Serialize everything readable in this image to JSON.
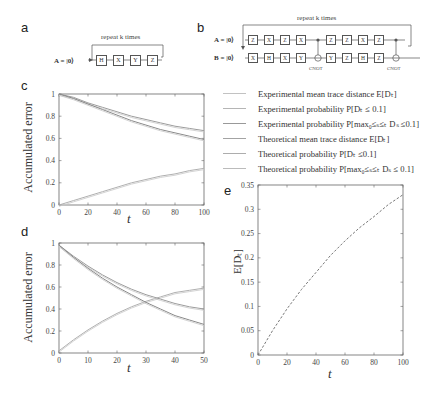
{
  "panels": {
    "a": {
      "letter": "a",
      "repeat_label": "repeat k times",
      "qubit_label": "A = |0⟩",
      "gates": [
        "H",
        "X",
        "Y",
        "Z"
      ]
    },
    "b": {
      "letter": "b",
      "repeat_label": "repeat k times",
      "qubit_a_label": "A = |0⟩",
      "qubit_b_label": "B = |0⟩",
      "gates_a": [
        "Z",
        "X",
        "Z",
        "X",
        "●",
        "Z",
        "Z",
        "X",
        "Z",
        "●"
      ],
      "gates_b": [
        "X",
        "H",
        "X",
        "Y",
        "⊕",
        "Y",
        "Z",
        "H",
        "Z",
        "⊕"
      ],
      "cnot_label": "CNOT"
    },
    "c": {
      "letter": "c"
    },
    "d": {
      "letter": "d"
    },
    "e": {
      "letter": "e"
    }
  },
  "legend": {
    "items": [
      {
        "label": "Experimental mean trace distance E[Dₜ]",
        "color": "#b7b7b7"
      },
      {
        "label": "Experimental probability P[Dₜ ≤ 0.1]",
        "color": "#a9a9a9"
      },
      {
        "label": "Experimental probability P[max₀≤ₛ≤ₜ Dₛ ≤0.1]",
        "color": "#8f8f8f"
      },
      {
        "label": "Theoretical mean trace distance E[Dₜ]",
        "color": "#9a9a9a"
      },
      {
        "label": "Theoretical probability P[Dₜ ≤0.1]",
        "color": "#a5a5a5"
      },
      {
        "label": "Theoretical probability P[max₀≤ₛ≤ₜ Dₛ ≤ 0.1]",
        "color": "#b0b0b0"
      }
    ]
  },
  "chart_data": [
    {
      "panel": "c",
      "type": "line",
      "title": "",
      "xlabel": "t",
      "ylabel": "Accumulated error",
      "xlim": [
        0,
        100
      ],
      "ylim": [
        0,
        1
      ],
      "xticks": [
        0,
        20,
        40,
        60,
        80,
        100
      ],
      "yticks": [
        0,
        0.2,
        0.4,
        0.6,
        0.8,
        1
      ],
      "x": [
        0,
        10,
        20,
        30,
        40,
        50,
        60,
        70,
        80,
        90,
        100
      ],
      "series": [
        {
          "name": "Mean trace distance E[Dt]",
          "values": [
            0.0,
            0.04,
            0.08,
            0.12,
            0.16,
            0.2,
            0.23,
            0.26,
            0.28,
            0.31,
            0.33
          ]
        },
        {
          "name": "Probability P[Dt ≤ 0.1]",
          "values": [
            1.0,
            0.97,
            0.92,
            0.88,
            0.84,
            0.8,
            0.77,
            0.74,
            0.71,
            0.69,
            0.67
          ]
        },
        {
          "name": "Probability P[max Ds ≤ 0.1]",
          "values": [
            1.0,
            0.96,
            0.91,
            0.86,
            0.81,
            0.76,
            0.72,
            0.68,
            0.65,
            0.62,
            0.59
          ]
        }
      ]
    },
    {
      "panel": "d",
      "type": "line",
      "title": "",
      "xlabel": "t",
      "ylabel": "Accumulated error",
      "xlim": [
        0,
        50
      ],
      "ylim": [
        0,
        1
      ],
      "xticks": [
        0,
        10,
        20,
        30,
        40,
        50
      ],
      "yticks": [
        0,
        0.2,
        0.4,
        0.6,
        0.8,
        1
      ],
      "x": [
        0,
        5,
        10,
        15,
        20,
        25,
        30,
        35,
        40,
        45,
        50
      ],
      "series": [
        {
          "name": "Mean trace distance E[Dt]",
          "values": [
            0.02,
            0.12,
            0.21,
            0.29,
            0.36,
            0.42,
            0.47,
            0.51,
            0.55,
            0.57,
            0.59
          ]
        },
        {
          "name": "Probability P[Dt ≤ 0.1]",
          "values": [
            0.98,
            0.88,
            0.79,
            0.71,
            0.64,
            0.58,
            0.53,
            0.49,
            0.45,
            0.42,
            0.4
          ]
        },
        {
          "name": "Probability P[max Ds ≤ 0.1]",
          "values": [
            0.98,
            0.87,
            0.77,
            0.68,
            0.6,
            0.53,
            0.46,
            0.4,
            0.34,
            0.3,
            0.26
          ]
        }
      ]
    },
    {
      "panel": "e",
      "type": "line",
      "title": "",
      "xlabel": "t",
      "ylabel": "E[Dₜ]",
      "xlim": [
        0,
        100
      ],
      "ylim": [
        0,
        0.35
      ],
      "xticks": [
        0,
        20,
        40,
        60,
        80,
        100
      ],
      "yticks": [
        0,
        0.05,
        0.1,
        0.15,
        0.2,
        0.25,
        0.3,
        0.35
      ],
      "x": [
        0,
        10,
        20,
        30,
        40,
        50,
        60,
        70,
        80,
        90,
        100
      ],
      "series": [
        {
          "name": "E[Dt]",
          "style": "dashed",
          "values": [
            0.0,
            0.05,
            0.095,
            0.135,
            0.17,
            0.205,
            0.235,
            0.262,
            0.285,
            0.31,
            0.33
          ]
        }
      ]
    }
  ]
}
